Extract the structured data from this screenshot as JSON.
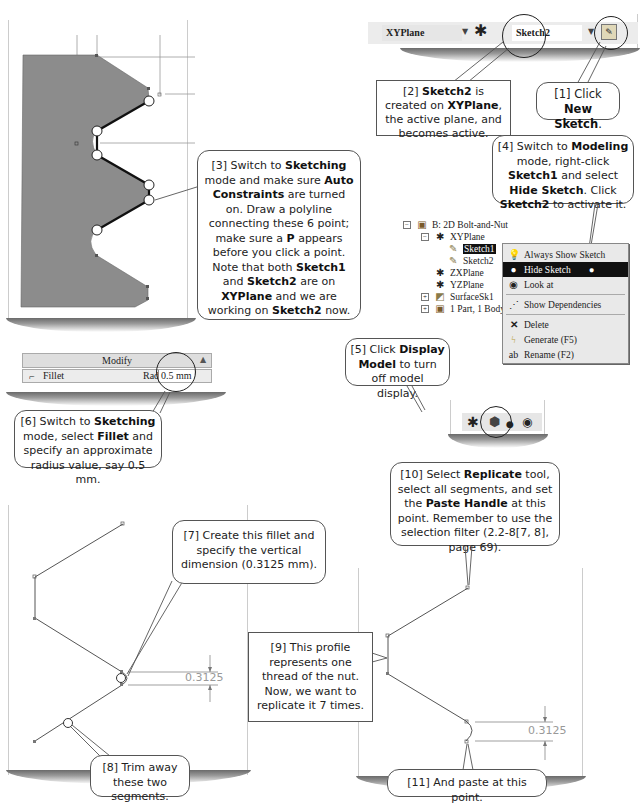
{
  "toolbar_top": {
    "plane_combo": "XYPlane",
    "sketch_combo": "Sketch2",
    "new_sketch_icon": "new-sketch-icon"
  },
  "callouts": {
    "c1": {
      "pre": "[1] Click ",
      "b1": "New Sketch",
      "post": "."
    },
    "c2": {
      "pre": "[2] ",
      "b1": "Sketch2",
      "mid1": " is created on ",
      "b2": "XYPlane",
      "post": ", the active plane, and becomes active."
    },
    "c3": {
      "p1": "[3] Switch to ",
      "b1": "Sketching",
      "p2": " mode and make sure ",
      "b2": "Auto Constraints",
      "p3": " are turned on. Draw a polyline connecting these 6 point; make sure a ",
      "b3": "P",
      "p4": " appears before you click a point.  Note that both ",
      "b4": "Sketch1",
      "p5": " and ",
      "b5": "Sketch2",
      "p6": " are on ",
      "b6": "XYPlane",
      "p7": " and we are working on ",
      "b7": "Sketch2",
      "p8": " now."
    },
    "c4": {
      "p1": "[4] Switch to ",
      "b1": "Modeling",
      "p2": " mode, right-click ",
      "b2": "Sketch1",
      "p3": " and select ",
      "b3": "Hide Sketch",
      "p4": ".  Click ",
      "b4": "Sketch2",
      "p5": " to activate it."
    },
    "c5": {
      "p1": "[5] Click ",
      "b1": "Display Model",
      "p2": " to turn off model display."
    },
    "c6": {
      "p1": "[6] Switch to ",
      "b1": "Sketching",
      "p2": " mode, select ",
      "b2": "Fillet",
      "p3": " and specify an approximate radius value, say 0.5 mm."
    },
    "c7": {
      "p1": "[7] Create this fillet and specify the vertical dimension (0.3125 mm)."
    },
    "c8": {
      "p1": "[8] Trim away these two segments."
    },
    "c9": {
      "p1": "[9] This profile represents one thread of the nut. Now, we want to replicate it 7 times."
    },
    "c10": {
      "p1": "[10] Select ",
      "b1": "Replicate",
      "p2": " tool, select all segments, and set the ",
      "b2": "Paste Handle",
      "p3": " at this point. Remember to use the selection filter (2.2-8[7, 8], page 69)."
    },
    "c11": {
      "p1": "[11] And paste at this point."
    }
  },
  "tree": {
    "root": "B: 2D Bolt-and-Nut",
    "items": [
      "XYPlane",
      "Sketch1",
      "Sketch2",
      "ZXPlane",
      "YZPlane",
      "SurfaceSk1",
      "1 Part, 1 Body"
    ]
  },
  "context_menu": {
    "items": [
      {
        "label": "Always Show Sketch",
        "icon": "lightbulb-icon"
      },
      {
        "label": "Hide Sketch",
        "icon": "dark-lightbulb-icon",
        "selected": true
      },
      {
        "label": "Look at",
        "icon": "look-at-icon"
      },
      {
        "label": "Show Dependencies",
        "icon": "dependencies-icon"
      },
      {
        "label": "Delete",
        "icon": "delete-icon"
      },
      {
        "label": "Generate (F5)",
        "icon": "generate-icon"
      },
      {
        "label": "Rename (F2)",
        "icon": "rename-icon"
      }
    ]
  },
  "modify_panel": {
    "title": "Modify",
    "tool": "Fillet",
    "radius_label": "Radius:",
    "radius_value": "0.5 mm"
  },
  "dimensions": {
    "left": "0.3125",
    "right": "0.3125"
  },
  "colors": {
    "model_fill": "#8c8c8c",
    "dim_text": "#999999"
  }
}
